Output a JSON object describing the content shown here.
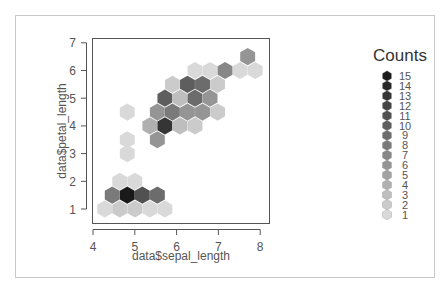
{
  "chart_data": {
    "type": "heatmap",
    "subtype": "hexbin",
    "title": "",
    "xlabel": "data$sepal_length",
    "ylabel": "data$petal_length",
    "xlim": [
      4,
      8
    ],
    "ylim": [
      0.6,
      7.2
    ],
    "x_ticks": [
      4,
      5,
      6,
      7,
      8
    ],
    "y_ticks": [
      1,
      2,
      3,
      4,
      5,
      6,
      7
    ],
    "grid": false,
    "legend": {
      "title": "Counts",
      "position": "right",
      "levels": [
        15,
        14,
        13,
        12,
        11,
        10,
        9,
        8,
        7,
        6,
        5,
        4,
        3,
        2,
        1
      ]
    },
    "hexbins": [
      {
        "x": 4.28,
        "y": 1.0,
        "count": 1
      },
      {
        "x": 4.64,
        "y": 1.0,
        "count": 2
      },
      {
        "x": 5.0,
        "y": 1.0,
        "count": 2
      },
      {
        "x": 5.36,
        "y": 1.0,
        "count": 1
      },
      {
        "x": 5.72,
        "y": 1.0,
        "count": 1
      },
      {
        "x": 4.46,
        "y": 1.5,
        "count": 8
      },
      {
        "x": 4.82,
        "y": 1.5,
        "count": 15
      },
      {
        "x": 5.18,
        "y": 1.5,
        "count": 11
      },
      {
        "x": 5.54,
        "y": 1.5,
        "count": 9
      },
      {
        "x": 4.64,
        "y": 2.0,
        "count": 1
      },
      {
        "x": 5.0,
        "y": 2.0,
        "count": 1
      },
      {
        "x": 4.82,
        "y": 3.0,
        "count": 1
      },
      {
        "x": 4.82,
        "y": 3.5,
        "count": 1
      },
      {
        "x": 4.82,
        "y": 4.5,
        "count": 1
      },
      {
        "x": 5.54,
        "y": 3.5,
        "count": 6
      },
      {
        "x": 5.36,
        "y": 4.0,
        "count": 4
      },
      {
        "x": 5.72,
        "y": 4.0,
        "count": 13
      },
      {
        "x": 6.08,
        "y": 4.0,
        "count": 3
      },
      {
        "x": 6.44,
        "y": 4.0,
        "count": 2
      },
      {
        "x": 5.54,
        "y": 4.5,
        "count": 6
      },
      {
        "x": 5.9,
        "y": 4.5,
        "count": 8
      },
      {
        "x": 6.26,
        "y": 4.5,
        "count": 6
      },
      {
        "x": 6.62,
        "y": 4.5,
        "count": 6
      },
      {
        "x": 6.98,
        "y": 4.5,
        "count": 2
      },
      {
        "x": 5.72,
        "y": 5.0,
        "count": 10
      },
      {
        "x": 6.08,
        "y": 5.0,
        "count": 3
      },
      {
        "x": 6.44,
        "y": 5.0,
        "count": 9
      },
      {
        "x": 6.8,
        "y": 5.0,
        "count": 6
      },
      {
        "x": 5.9,
        "y": 5.5,
        "count": 2
      },
      {
        "x": 6.26,
        "y": 5.5,
        "count": 10
      },
      {
        "x": 6.62,
        "y": 5.5,
        "count": 9
      },
      {
        "x": 6.98,
        "y": 5.5,
        "count": 2
      },
      {
        "x": 6.44,
        "y": 6.0,
        "count": 1
      },
      {
        "x": 6.8,
        "y": 6.0,
        "count": 1
      },
      {
        "x": 7.16,
        "y": 6.0,
        "count": 7
      },
      {
        "x": 7.52,
        "y": 6.0,
        "count": 1
      },
      {
        "x": 7.88,
        "y": 6.0,
        "count": 1
      },
      {
        "x": 7.7,
        "y": 6.5,
        "count": 6
      }
    ],
    "colors": {
      "min": "#d9d9d9",
      "max": "#1a1a1a"
    }
  },
  "labels": {
    "x_axis_title": "data$sepal_length",
    "y_axis_title": "data$petal_length",
    "legend_title": "Counts"
  }
}
